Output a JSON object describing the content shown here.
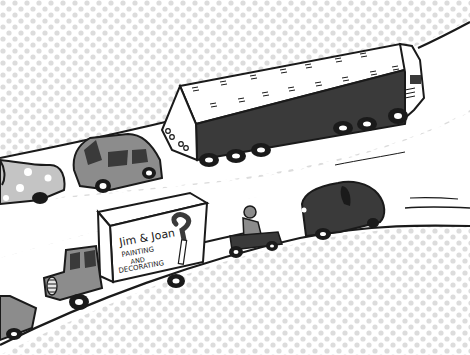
{
  "illustration": {
    "subject": "cartoon highway traffic",
    "van_sign": {
      "line1": "Jim & Joan",
      "line2": "PAINTING",
      "line3": "AND",
      "line4": "DECORATING"
    },
    "vehicles": [
      "articulated-lorry",
      "grey-saloon-car",
      "spotted-beetle-car",
      "painting-van",
      "scooter-rider",
      "dark-beetle-car",
      "grey-car-partial"
    ]
  },
  "colors": {
    "background": "#ffffff",
    "dots": "#dcdcdc",
    "ink": "#1a1a1a",
    "road": "#ffffff",
    "dark_body": "#3a3a3a",
    "grey_body": "#8c8c8c",
    "light_grey": "#c4c4c4"
  }
}
